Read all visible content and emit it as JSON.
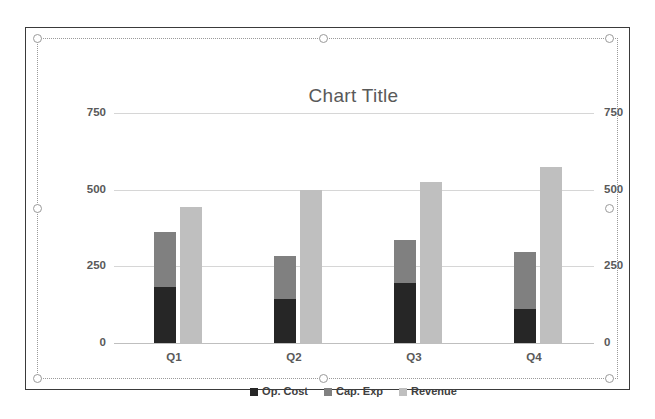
{
  "window": {
    "background_color": "#ffffff",
    "frame_border_color": "#3a3a3a",
    "selection_border_color": "#9a9a9a",
    "selection_state": "selected"
  },
  "chart_data": {
    "type": "bar",
    "subtype": "clustered-stacked-column",
    "title": "Chart Title",
    "xlabel": "",
    "ylabel": "",
    "categories": [
      "Q1",
      "Q2",
      "Q3",
      "Q4"
    ],
    "series": [
      {
        "name": "Op. Cost",
        "color": "#262626",
        "stack": "A",
        "values": [
          183,
          143,
          196,
          110
        ]
      },
      {
        "name": "Cap. Exp",
        "color": "#808080",
        "stack": "A",
        "values": [
          178,
          140,
          140,
          186
        ]
      },
      {
        "name": "Revenue",
        "color": "#bfbfbf",
        "stack": "B",
        "values": [
          442,
          500,
          525,
          575
        ]
      }
    ],
    "stack_totals": {
      "Op. Cost + Cap. Exp": [
        361,
        283,
        336,
        296
      ]
    },
    "yaxis_left": {
      "ticks": [
        "0",
        "250",
        "500",
        "750"
      ],
      "min": 0,
      "max": 750,
      "step": 250
    },
    "yaxis_right": {
      "ticks": [
        "0",
        "250",
        "500",
        "750"
      ],
      "min": 0,
      "max": 750,
      "step": 250
    },
    "ylim": [
      0,
      750
    ],
    "grid": true,
    "grid_color": "#d6d6d6",
    "legend_position": "bottom",
    "legend_entries": [
      "Op. Cost",
      "Cap. Exp",
      "Revenue"
    ],
    "tick_color": "#595959",
    "title_color": "#595959"
  },
  "selection_handles": [
    "top-left",
    "top-middle",
    "top-right",
    "middle-left",
    "middle-right",
    "bottom-left",
    "bottom-middle",
    "bottom-right"
  ]
}
